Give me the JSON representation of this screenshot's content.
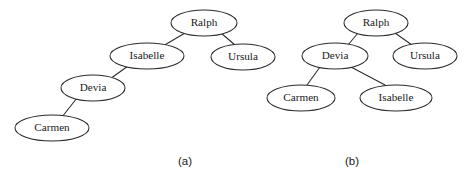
{
  "figure": {
    "background_color": "#ffffff",
    "stroke_color": "#2b2b2b",
    "text_color": "#1a1a1a",
    "width": 476,
    "height": 183
  },
  "diagrams": [
    {
      "id": "a",
      "caption": "(a)",
      "caption_x": 185,
      "caption_y": 162,
      "shape_description": "left-leaning degenerate chain",
      "nodes": [
        {
          "id": "a-ralph",
          "label": "Ralph",
          "cx": 204,
          "cy": 23,
          "rx": 33,
          "ry": 13
        },
        {
          "id": "a-isabelle",
          "label": "Isabelle",
          "cx": 147,
          "cy": 56,
          "rx": 37,
          "ry": 13
        },
        {
          "id": "a-ursula",
          "label": "Ursula",
          "cx": 243,
          "cy": 57,
          "rx": 32,
          "ry": 13
        },
        {
          "id": "a-devia",
          "label": "Devia",
          "cx": 93,
          "cy": 88,
          "rx": 32,
          "ry": 13
        },
        {
          "id": "a-carmen",
          "label": "Carmen",
          "cx": 52,
          "cy": 128,
          "rx": 37,
          "ry": 13
        }
      ],
      "edges": [
        {
          "id": "a-e1",
          "from": "a-ralph",
          "to": "a-isabelle",
          "x1": 185,
          "y1": 33,
          "x2": 163,
          "y2": 46
        },
        {
          "id": "a-e2",
          "from": "a-ralph",
          "to": "a-ursula",
          "x1": 221,
          "y1": 33,
          "x2": 235,
          "y2": 45
        },
        {
          "id": "a-e3",
          "from": "a-isabelle",
          "to": "a-devia",
          "x1": 128,
          "y1": 66,
          "x2": 110,
          "y2": 79
        },
        {
          "id": "a-e4",
          "from": "a-devia",
          "to": "a-carmen",
          "x1": 77,
          "y1": 98,
          "x2": 62,
          "y2": 117
        }
      ]
    },
    {
      "id": "b",
      "caption": "(b)",
      "caption_x": 352,
      "caption_y": 162,
      "shape_description": "balanced tree",
      "nodes": [
        {
          "id": "b-ralph",
          "label": "Ralph",
          "cx": 376,
          "cy": 23,
          "rx": 32,
          "ry": 13
        },
        {
          "id": "b-devia",
          "label": "Devia",
          "cx": 335,
          "cy": 56,
          "rx": 33,
          "ry": 13
        },
        {
          "id": "b-ursula",
          "label": "Ursula",
          "cx": 425,
          "cy": 56,
          "rx": 32,
          "ry": 13
        },
        {
          "id": "b-carmen",
          "label": "Carmen",
          "cx": 301,
          "cy": 98,
          "rx": 34,
          "ry": 13
        },
        {
          "id": "b-isabelle",
          "label": "Isabelle",
          "cx": 396,
          "cy": 98,
          "rx": 36,
          "ry": 13
        }
      ],
      "edges": [
        {
          "id": "b-e1",
          "from": "b-ralph",
          "to": "b-devia",
          "x1": 358,
          "y1": 33,
          "x2": 348,
          "y2": 45
        },
        {
          "id": "b-e2",
          "from": "b-ralph",
          "to": "b-ursula",
          "x1": 395,
          "y1": 33,
          "x2": 412,
          "y2": 45
        },
        {
          "id": "b-e3",
          "from": "b-devia",
          "to": "b-carmen",
          "x1": 320,
          "y1": 67,
          "x2": 307,
          "y2": 85
        },
        {
          "id": "b-e4",
          "from": "b-devia",
          "to": "b-isabelle",
          "x1": 351,
          "y1": 67,
          "x2": 385,
          "y2": 85
        }
      ]
    }
  ]
}
